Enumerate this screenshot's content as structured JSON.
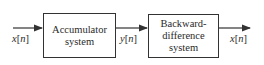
{
  "diagram": {
    "type": "block-diagram",
    "blocks": [
      {
        "id": "accumulator",
        "line1": "Accumulator",
        "line2": "system"
      },
      {
        "id": "backward-difference",
        "line1": "Backward-",
        "line2": "difference",
        "line3": "system"
      }
    ],
    "signals": {
      "input": {
        "var": "x",
        "idx": "n"
      },
      "intermediate": {
        "var": "y",
        "idx": "n"
      },
      "output": {
        "var": "x",
        "idx": "n"
      }
    },
    "colors": {
      "stroke": "#333333",
      "text": "#2a2a2a",
      "background": "#ffffff"
    }
  }
}
